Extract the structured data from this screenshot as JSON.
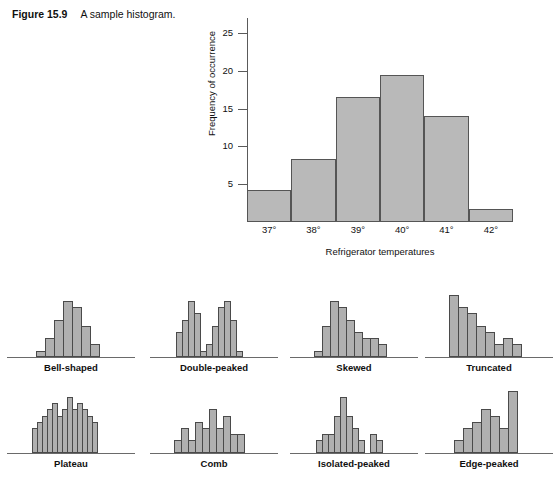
{
  "caption": {
    "figure_number": "Figure 15.9",
    "text": "A sample histogram."
  },
  "chart_data": [
    {
      "id": "main_histogram",
      "type": "bar",
      "title": "",
      "xlabel": "Refrigerator temperatures",
      "ylabel": "Frequency of occurrence",
      "categories": [
        "37°",
        "38°",
        "39°",
        "40°",
        "41°",
        "42°"
      ],
      "values": [
        4.3,
        8.3,
        16.5,
        19.5,
        14.0,
        1.7
      ],
      "ytick_values": [
        5,
        10,
        15,
        20,
        25
      ],
      "ytick_labels": [
        "5",
        "10",
        "15",
        "20",
        "25"
      ],
      "ylim": [
        0,
        27
      ],
      "grid": false,
      "legend": "none",
      "bar_fill": "#b9b9b9",
      "bar_stroke": "#555555"
    },
    {
      "id": "bell_shaped",
      "type": "bar",
      "title": "Bell-shaped",
      "categories": [
        "1",
        "2",
        "3",
        "4",
        "5",
        "6",
        "7"
      ],
      "values": [
        1,
        3,
        6,
        9,
        8,
        5,
        2
      ],
      "ylim": [
        0,
        10
      ]
    },
    {
      "id": "double_peaked",
      "type": "bar",
      "title": "Double-peaked",
      "categories": [
        "1",
        "2",
        "3",
        "4",
        "5",
        "6",
        "7",
        "8",
        "9",
        "10",
        "11"
      ],
      "values": [
        4,
        6,
        9,
        7,
        1,
        2,
        5,
        8,
        9,
        6,
        1
      ],
      "ylim": [
        0,
        10
      ]
    },
    {
      "id": "skewed",
      "type": "bar",
      "title": "Skewed",
      "categories": [
        "1",
        "2",
        "3",
        "4",
        "5",
        "6",
        "7",
        "8",
        "9"
      ],
      "values": [
        1,
        5,
        9,
        8,
        6,
        4,
        3,
        3,
        2
      ],
      "ylim": [
        0,
        10
      ]
    },
    {
      "id": "truncated",
      "type": "bar",
      "title": "Truncated",
      "categories": [
        "1",
        "2",
        "3",
        "4",
        "5",
        "6",
        "7",
        "8"
      ],
      "values": [
        10,
        8,
        7,
        5,
        4,
        2,
        3,
        2
      ],
      "ylim": [
        0,
        10
      ]
    },
    {
      "id": "plateau",
      "type": "bar",
      "title": "Plateau",
      "categories": [
        "1",
        "2",
        "3",
        "4",
        "5",
        "6",
        "7",
        "8",
        "9",
        "10",
        "11",
        "12",
        "13"
      ],
      "values": [
        4,
        5,
        6,
        7,
        8,
        6,
        7,
        9,
        7,
        8,
        7,
        6,
        5
      ],
      "ylim": [
        0,
        10
      ]
    },
    {
      "id": "comb",
      "type": "bar",
      "title": "Comb",
      "categories": [
        "1",
        "2",
        "3",
        "4",
        "5",
        "6",
        "7",
        "8",
        "9",
        "10"
      ],
      "values": [
        2,
        4,
        2,
        5,
        4,
        7,
        4,
        6,
        3,
        3
      ],
      "ylim": [
        0,
        10
      ]
    },
    {
      "id": "isolated_peaked",
      "type": "bar",
      "title": "Isolated-peaked",
      "categories": [
        "1",
        "2",
        "3",
        "4",
        "5",
        "6",
        "7",
        "8",
        "9",
        "10",
        "11"
      ],
      "values": [
        2,
        3,
        3,
        6,
        9,
        6,
        4,
        2,
        0,
        3,
        2
      ],
      "ylim": [
        0,
        10
      ]
    },
    {
      "id": "edge_peaked",
      "type": "bar",
      "title": "Edge-peaked",
      "categories": [
        "1",
        "2",
        "3",
        "4",
        "5",
        "6",
        "7"
      ],
      "values": [
        2,
        4,
        5,
        7,
        6,
        4,
        10
      ],
      "ylim": [
        0,
        10
      ]
    }
  ]
}
